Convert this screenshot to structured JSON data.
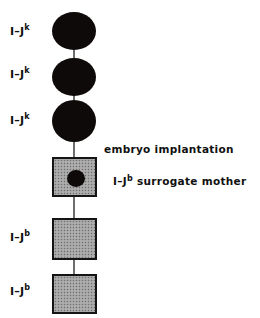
{
  "figure": {
    "type": "pedigree-lineage-diagram",
    "width": 260,
    "height": 318,
    "background_color": "#ffffff"
  },
  "colors": {
    "donor_fill": "#0d0a09",
    "recipient_fill": "#a3a3a3",
    "recipient_border": "#141414",
    "connector": "#6e6e6e",
    "text": "#101010"
  },
  "nodes": [
    {
      "id": "node-1",
      "shape": "circle",
      "fill": "solid-black",
      "label_prefix": "I–J",
      "label_superscript": "k",
      "label_full": "I–J",
      "generation": 1
    },
    {
      "id": "node-2",
      "shape": "circle",
      "fill": "solid-black",
      "label_prefix": "I–J",
      "label_superscript": "k",
      "label_full": "I–J",
      "generation": 2
    },
    {
      "id": "node-3",
      "shape": "circle",
      "fill": "solid-black",
      "label_prefix": "I–J",
      "label_superscript": "k",
      "label_full": "I–J",
      "generation": 3
    },
    {
      "id": "node-4",
      "shape": "square",
      "fill": "stippled-gray",
      "contains_embryo": true,
      "label_prefix": "",
      "label_superscript": "",
      "generation": 4
    },
    {
      "id": "node-5",
      "shape": "square",
      "fill": "stippled-gray",
      "contains_embryo": false,
      "label_prefix": "I–J",
      "label_superscript": "b",
      "generation": 5
    },
    {
      "id": "node-6",
      "shape": "square",
      "fill": "stippled-gray",
      "contains_embryo": false,
      "label_prefix": "I–J",
      "label_superscript": "b",
      "generation": 6
    }
  ],
  "labels": {
    "node1": {
      "text": "I–J",
      "sup": "k"
    },
    "node2": {
      "text": "I–J",
      "sup": "k"
    },
    "node3": {
      "text": "I–J",
      "sup": "k"
    },
    "node5": {
      "text": "I–J",
      "sup": "b"
    },
    "node6": {
      "text": "I–J",
      "sup": "b"
    }
  },
  "annotations": {
    "implantation": {
      "text": "embryo implantation"
    },
    "surrogate": {
      "prefix": "I–J",
      "sup": "b",
      "suffix": " surrogate mother"
    }
  }
}
